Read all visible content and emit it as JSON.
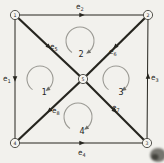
{
  "figure": {
    "description_label": "graph-with-5-vertices-8-edges-4-mesh-loops",
    "colors": {
      "background": "#f2f1ed",
      "ink": "#26251f",
      "loop_gray": "#9b9a94",
      "vertex_fill": "#f5f4f0",
      "artifact": "#4c4b44"
    },
    "vertices": [
      {
        "id": "v1",
        "label": "1",
        "x": 15,
        "y": 15
      },
      {
        "id": "v2",
        "label": "2",
        "x": 148,
        "y": 15
      },
      {
        "id": "v3",
        "label": "3",
        "x": 147,
        "y": 143
      },
      {
        "id": "v4",
        "label": "4",
        "x": 15,
        "y": 143
      },
      {
        "id": "v5",
        "label": "5",
        "x": 83,
        "y": 79
      }
    ],
    "edges": [
      {
        "id": "e1",
        "from": "v1",
        "to": "v4",
        "thick": false,
        "label": {
          "text": "e",
          "sub": "1",
          "x": 3,
          "y": 81
        },
        "arrow": {
          "x": 15,
          "y": 79,
          "angle": 90
        }
      },
      {
        "id": "e2",
        "from": "v1",
        "to": "v2",
        "thick": false,
        "label": {
          "text": "e",
          "sub": "2",
          "x": 76,
          "y": 9
        },
        "arrow": {
          "x": 82,
          "y": 15,
          "angle": 0
        }
      },
      {
        "id": "e3",
        "from": "v2",
        "to": "v3",
        "thick": false,
        "label": {
          "text": "e",
          "sub": "3",
          "x": 151,
          "y": 80
        },
        "arrow": {
          "x": 148,
          "y": 76,
          "angle": 270
        }
      },
      {
        "id": "e4",
        "from": "v4",
        "to": "v3",
        "thick": false,
        "label": {
          "text": "e",
          "sub": "4",
          "x": 78,
          "y": 155
        },
        "arrow": {
          "x": 82,
          "y": 143,
          "angle": 0
        }
      },
      {
        "id": "e5",
        "from": "v1",
        "to": "v5",
        "thick": true,
        "label": {
          "text": "e",
          "sub": "5",
          "x": 50,
          "y": 49
        },
        "arrow": {
          "x": 49,
          "y": 47,
          "angle": 43
        }
      },
      {
        "id": "e6",
        "from": "v2",
        "to": "v5",
        "thick": true,
        "label": {
          "text": "e",
          "sub": "6",
          "x": 109,
          "y": 54
        },
        "arrow": {
          "x": 115,
          "y": 47,
          "angle": 136
        }
      },
      {
        "id": "e7",
        "from": "v5",
        "to": "v3",
        "thick": true,
        "label": {
          "text": "e",
          "sub": "7",
          "x": 112,
          "y": 110
        },
        "arrow": {
          "x": 115,
          "y": 111,
          "angle": 45
        }
      },
      {
        "id": "e8",
        "from": "v5",
        "to": "v4",
        "thick": true,
        "label": {
          "text": "e",
          "sub": "8",
          "x": 52,
          "y": 113
        },
        "arrow": {
          "x": 49,
          "y": 111,
          "angle": 137
        }
      }
    ],
    "loops": [
      {
        "id": "loop1",
        "label": "1",
        "cx": 40,
        "cy": 79,
        "r": 13,
        "start_deg": 235,
        "end_deg": 305,
        "label_x": 44,
        "label_y": 95
      },
      {
        "id": "loop2",
        "label": "2",
        "cx": 80,
        "cy": 41,
        "r": 14,
        "start_deg": 235,
        "end_deg": 305,
        "label_x": 81,
        "label_y": 57
      },
      {
        "id": "loop3",
        "label": "3",
        "cx": 116,
        "cy": 79,
        "r": 13,
        "start_deg": 235,
        "end_deg": 305,
        "label_x": 121,
        "label_y": 95
      },
      {
        "id": "loop4",
        "label": "4",
        "cx": 78,
        "cy": 117,
        "r": 14,
        "start_deg": 235,
        "end_deg": 305,
        "label_x": 82,
        "label_y": 134
      }
    ],
    "artifact": {
      "x": 158,
      "y": 155,
      "rx": 8,
      "ry": 7
    }
  }
}
